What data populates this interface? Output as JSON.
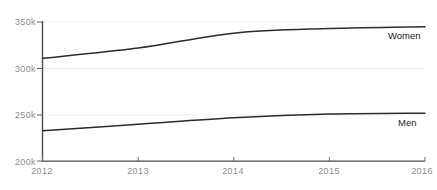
{
  "chart_data": {
    "type": "line",
    "title": "",
    "subtitle": "",
    "xlabel": "",
    "ylabel": "",
    "x": [
      2012,
      2013,
      2014,
      2015,
      2016
    ],
    "xtick_labels": [
      "2012",
      "2013",
      "2014",
      "2015",
      "2016"
    ],
    "ytick_labels": [
      "350k",
      "300k",
      "250k",
      "200k"
    ],
    "ytick_values": [
      350000,
      300000,
      250000,
      200000
    ],
    "xlim": [
      2012,
      2016
    ],
    "ylim": [
      200000,
      350000
    ],
    "grid": "horizontal",
    "legend_position": "inline-right",
    "series": [
      {
        "name": "Women",
        "label": "Women",
        "color": "#2b2b2b",
        "values": [
          311000,
          322000,
          338000,
          343000,
          345000
        ]
      },
      {
        "name": "Men",
        "label": "Men",
        "color": "#2b2b2b",
        "values": [
          233000,
          240000,
          247000,
          251000,
          252000
        ]
      }
    ],
    "axis_color": "#4a4a4a",
    "grid_color": "#ededed",
    "tick_label_color": "#8d8d8d"
  },
  "axes": {
    "y_ticks": [
      {
        "label": "350k",
        "top": 17
      },
      {
        "label": "300k",
        "top": 64
      },
      {
        "label": "250k",
        "top": 110
      },
      {
        "label": "200k",
        "top": 157
      }
    ],
    "x_ticks": [
      {
        "label": "2012",
        "left": 22
      },
      {
        "label": "2013",
        "left": 118
      },
      {
        "label": "2014",
        "left": 213
      },
      {
        "label": "2015",
        "left": 309
      },
      {
        "label": "2016",
        "left": 402
      }
    ]
  },
  "series_labels": [
    {
      "label": "Women",
      "left": 388,
      "top": 30
    },
    {
      "label": "Men",
      "left": 398,
      "top": 117
    }
  ]
}
